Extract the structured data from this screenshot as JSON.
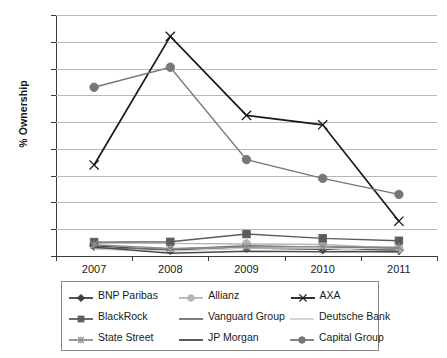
{
  "chart_data": {
    "type": "line",
    "title": "",
    "xlabel": "",
    "ylabel": "% Ownership",
    "categories": [
      "2007",
      "2008",
      "2009",
      "2010",
      "2011"
    ],
    "ylim": [
      0,
      9
    ],
    "yticks": [
      0,
      1,
      2,
      3,
      4,
      5,
      6,
      7,
      8,
      9
    ],
    "grid": true,
    "legend_position": "bottom",
    "series": [
      {
        "name": "BNP Paribas",
        "marker": "diamond",
        "color": "#3f3f3f",
        "values": [
          0.38,
          0.22,
          0.3,
          0.25,
          0.22
        ]
      },
      {
        "name": "Allianz",
        "marker": "circle",
        "color": "#b5b5b5",
        "values": [
          0.48,
          0.47,
          0.45,
          0.43,
          0.28
        ]
      },
      {
        "name": "AXA",
        "marker": "x",
        "color": "#1a1a1a",
        "values": [
          3.4,
          8.2,
          5.25,
          4.9,
          1.3
        ]
      },
      {
        "name": "BlackRock",
        "marker": "square",
        "color": "#5c5c5c",
        "values": [
          0.52,
          0.53,
          0.82,
          0.66,
          0.57
        ]
      },
      {
        "name": "Vanguard Group",
        "marker": "none",
        "color": "#6e6e6e",
        "values": [
          0.3,
          0.25,
          0.38,
          0.33,
          0.3
        ]
      },
      {
        "name": "Deutsche Bank",
        "marker": "none",
        "color": "#d2d2d2",
        "values": [
          0.25,
          0.18,
          0.3,
          0.3,
          0.12
        ]
      },
      {
        "name": "State Street",
        "marker": "star",
        "color": "#8e8e8e",
        "values": [
          0.42,
          0.28,
          0.33,
          0.35,
          0.33
        ]
      },
      {
        "name": "JP Morgan",
        "marker": "none",
        "color": "#4a4a4a",
        "values": [
          0.33,
          0.1,
          0.18,
          0.16,
          0.16
        ]
      },
      {
        "name": "Capital Group",
        "marker": "circle",
        "color": "#777777",
        "values": [
          6.3,
          7.05,
          3.6,
          2.9,
          2.3
        ]
      }
    ]
  },
  "axes": {
    "y_title": "% Ownership",
    "y_tick_labels": [
      "0",
      "1",
      "2",
      "3",
      "4",
      "5",
      "6",
      "7",
      "8",
      "9"
    ],
    "x_tick_labels": [
      "2007",
      "2008",
      "2009",
      "2010",
      "2011"
    ]
  },
  "legend": {
    "rows": [
      [
        {
          "label": "BNP Paribas",
          "marker": "diamond",
          "color": "#3f3f3f"
        },
        {
          "label": "Allianz",
          "marker": "circle",
          "color": "#b5b5b5"
        },
        {
          "label": "AXA",
          "marker": "x",
          "color": "#1a1a1a"
        }
      ],
      [
        {
          "label": "BlackRock",
          "marker": "square",
          "color": "#5c5c5c"
        },
        {
          "label": "Vanguard Group",
          "marker": "none",
          "color": "#6e6e6e"
        },
        {
          "label": "Deutsche Bank",
          "marker": "none",
          "color": "#d2d2d2"
        }
      ],
      [
        {
          "label": "State Street",
          "marker": "star",
          "color": "#8e8e8e"
        },
        {
          "label": "JP Morgan",
          "marker": "none",
          "color": "#4a4a4a"
        },
        {
          "label": "Capital Group",
          "marker": "circle",
          "color": "#777777"
        }
      ]
    ]
  },
  "colors": {
    "background": "#ffffff",
    "axis": "#3a3a3a",
    "gridline": "#b9b9b9",
    "legend_border": "#8a8a8a",
    "text": "#1a1a1a"
  }
}
